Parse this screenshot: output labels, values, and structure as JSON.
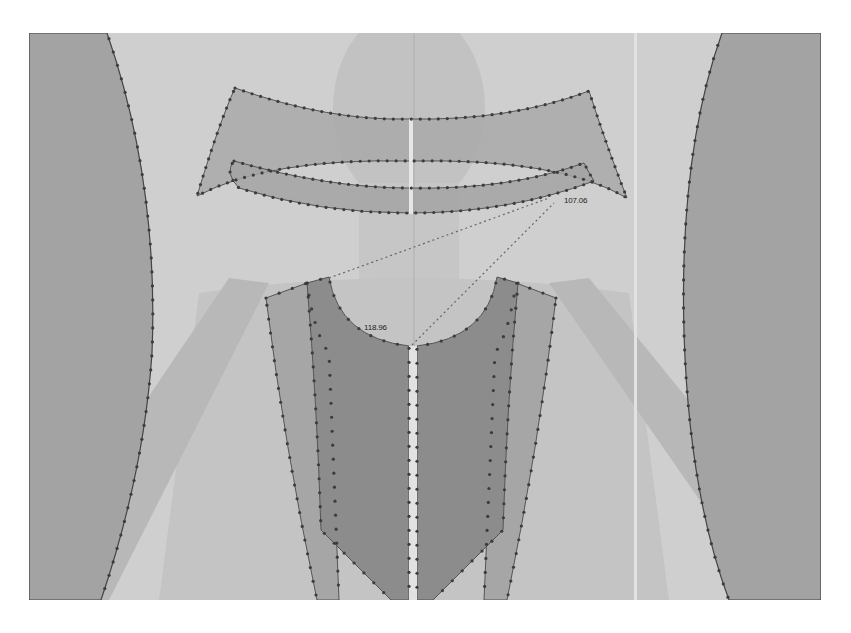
{
  "app": {
    "view": "3D garment simulation viewport",
    "colors": {
      "background": "#cfcfcf",
      "avatar_shade": "#bcbcbc",
      "avatar_light": "#c4c4c4",
      "side_panel": "#a3a3a3",
      "collar_panel": "#a9a9a9",
      "bodice_outer": "#a6a6a6",
      "bodice_inner": "#8c8c8c",
      "seam_stroke": "#555555",
      "seam_point": "#3c3c3c",
      "guide_line": "#e6e6e6"
    }
  },
  "measurements": [
    {
      "id": "collar-seam-length",
      "value": "107.06"
    },
    {
      "id": "neckline-seam-length",
      "value": "118.96"
    }
  ],
  "panels": [
    {
      "name": "left-side-panel"
    },
    {
      "name": "right-side-panel"
    },
    {
      "name": "collar-upper-band"
    },
    {
      "name": "collar-lower-band"
    },
    {
      "name": "bodice-front-left-outer"
    },
    {
      "name": "bodice-front-right-outer"
    },
    {
      "name": "bodice-front-left-inner"
    },
    {
      "name": "bodice-front-right-inner"
    }
  ]
}
